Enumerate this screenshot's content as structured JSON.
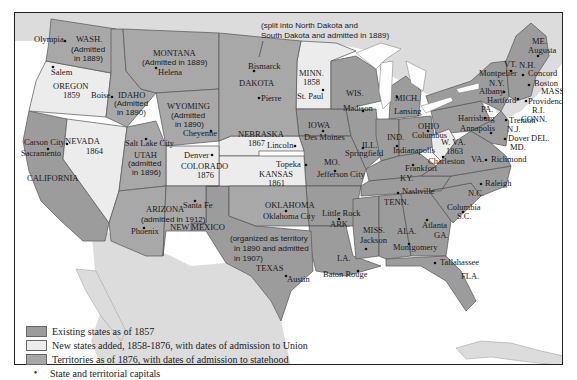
{
  "map": {
    "colors": {
      "existing": "#9c9c9c",
      "new_states": "#ececec",
      "territories": "#a8a8a8",
      "water": "#ffffff",
      "foreign_land": "#dcdcdc",
      "border": "#555555",
      "ink": "#1a1a1a"
    },
    "top_annotation": [
      "(split into North Dakota and",
      "South Dakota and admitted in 1889)"
    ],
    "texas_note": [
      "(organized as territory",
      "in 1890 and admitted",
      "in 1907)"
    ],
    "states": {
      "wash": {
        "name": "WASH.",
        "note": [
          "(Admitted",
          "in 1889)"
        ],
        "capital": "Olympia"
      },
      "oregon": {
        "name": "OREGON",
        "year": "1859",
        "capital": "Salem"
      },
      "california": {
        "name": "CALIFORNIA",
        "capital": "Sacramento"
      },
      "nevada": {
        "name": "NEVADA",
        "year": "1864",
        "capital": "Carson City"
      },
      "idaho": {
        "name": "IDAHO",
        "note": [
          "(Admitted",
          "in 1890)"
        ],
        "capital": "Boise"
      },
      "montana": {
        "name": "MONTANA",
        "note": "(Admitted in 1889)",
        "capital": "Helena"
      },
      "wyoming": {
        "name": "WYOMING",
        "note": [
          "(Admitted",
          "in 1890)"
        ],
        "capital": "Cheyenne"
      },
      "utah": {
        "name": "UTAH",
        "note": [
          "(admitted",
          "in 1896)"
        ],
        "capital": "Salt Lake City"
      },
      "colorado": {
        "name": "COLORADO",
        "year": "1876",
        "capital": "Denver"
      },
      "arizona": {
        "name": "ARIZONA",
        "note": "(admitted in 1912)",
        "capital": "Phoenix"
      },
      "new_mexico": {
        "name": "NEW MEXICO",
        "capital": "Santa Fe"
      },
      "dakota": {
        "name": "DAKOTA",
        "capitals": [
          "Bismarck",
          "Pierre"
        ]
      },
      "nebraska": {
        "name": "NEBRASKA",
        "year": "1867",
        "capital": "Lincoln"
      },
      "kansas": {
        "name": "KANSAS",
        "year": "1861",
        "capital": "Topeka"
      },
      "oklahoma": {
        "name": "OKLAHOMA",
        "capital": "Oklahoma City"
      },
      "texas": {
        "name": "TEXAS",
        "capital": "Austin"
      },
      "minn": {
        "name": "MINN.",
        "year": "1858",
        "capital": "St. Paul"
      },
      "iowa": {
        "name": "IOWA",
        "capital": "Des Moines"
      },
      "mo": {
        "name": "MO.",
        "capital": "Jefferson City"
      },
      "ark": {
        "name": "ARK.",
        "capital": "Little Rock"
      },
      "la": {
        "name": "LA.",
        "capital": "Baton Rouge"
      },
      "wis": {
        "name": "WIS.",
        "capital": "Madison"
      },
      "ill": {
        "name": "ILL.",
        "capital": "Springfield"
      },
      "mich": {
        "name": "MICH.",
        "capital": "Lansing"
      },
      "ind": {
        "name": "IND.",
        "capital": "Indianapolis"
      },
      "ohio": {
        "name": "OHIO",
        "capital": "Columbus"
      },
      "ky": {
        "name": "KY.",
        "capital": "Frankfort"
      },
      "tenn": {
        "name": "TENN.",
        "capital": "Nashville"
      },
      "miss": {
        "name": "MISS.",
        "capital": "Jackson"
      },
      "ala": {
        "name": "ALA.",
        "capital": "Montgomery"
      },
      "ga": {
        "name": "GA.",
        "capital": "Atlanta"
      },
      "fla": {
        "name": "FLA.",
        "capital": "Tallahassee"
      },
      "sc": {
        "name": "S.C.",
        "capital": "Columbia"
      },
      "nc": {
        "name": "N.C.",
        "capital": "Raleigh"
      },
      "va": {
        "name": "VA.",
        "capital": "Richmond"
      },
      "wva": {
        "name": "W. VA.",
        "year": "1863",
        "capital": "Charleston"
      },
      "md": {
        "name": "MD.",
        "capital": "Annapolis"
      },
      "del": {
        "name": "DEL.",
        "capital": "Dover"
      },
      "pa": {
        "name": "PA.",
        "capital": "Harrisburg"
      },
      "nj": {
        "name": "N.J.",
        "capital": "Trenton"
      },
      "ny": {
        "name": "N.Y.",
        "capital": "Albany"
      },
      "conn": {
        "name": "CONN.",
        "capital": "Hartford"
      },
      "ri": {
        "name": "R.I.",
        "capital": "Providence"
      },
      "mass": {
        "name": "MASS.",
        "capital": "Boston"
      },
      "vt": {
        "name": "VT.",
        "capital": "Montpelier"
      },
      "nh": {
        "name": "N.H.",
        "capital": "Concord"
      },
      "me": {
        "name": "ME.",
        "capital": "Augusta"
      }
    }
  },
  "legend": {
    "items": [
      {
        "label": "Existing states as of 1857",
        "type": "swatch",
        "color": "#9c9c9c"
      },
      {
        "label": "New states added, 1858-1876, with dates of admission to Union",
        "type": "swatch",
        "color": "#ececec"
      },
      {
        "label": "Territories as of 1876, with dates of admission to statehood",
        "type": "swatch",
        "color": "#a8a8a8"
      },
      {
        "label": "State and territorial capitals",
        "type": "dot",
        "symbol": "•"
      }
    ]
  }
}
